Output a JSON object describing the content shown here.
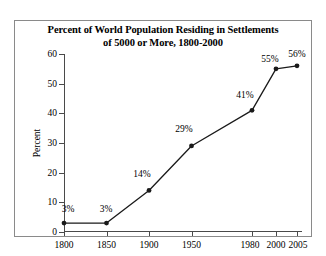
{
  "chart_data": {
    "type": "line",
    "title": "Percent of World Population Residing in Settlements of 5000 or More, 1800-2000",
    "title_lines": [
      "Percent of World Population Residing in Settlements",
      "of 5000 or More, 1800-2000"
    ],
    "xlabel": "",
    "ylabel": "Percent",
    "x": [
      1800,
      1850,
      1900,
      1950,
      1980,
      2000,
      2005
    ],
    "categories": [
      "1800",
      "1850",
      "1900",
      "1950",
      "1980",
      "2000",
      "2005"
    ],
    "values": [
      3,
      3,
      14,
      29,
      41,
      55,
      56
    ],
    "point_labels": [
      "3%",
      "3%",
      "14%",
      "29%",
      "41%",
      "55%",
      "56%"
    ],
    "xtick_labels": [
      "1800",
      "1850",
      "1900",
      "1950",
      "1980",
      "2000",
      "2005"
    ],
    "ytick_labels": [
      "0",
      "10",
      "20",
      "30",
      "40",
      "50",
      "60"
    ],
    "ytick_values": [
      0,
      10,
      20,
      30,
      40,
      50,
      60
    ],
    "ylim": [
      0,
      60
    ],
    "xlim": [
      1800,
      2010
    ],
    "grid": false,
    "legend": false,
    "marker": "filled-circle",
    "line_color": "#1a1a1a",
    "marker_color": "#1a1a1a",
    "axis_color": "#4a4a4a",
    "border_color": "#8a8a8a",
    "background_color": "#ffffff"
  }
}
